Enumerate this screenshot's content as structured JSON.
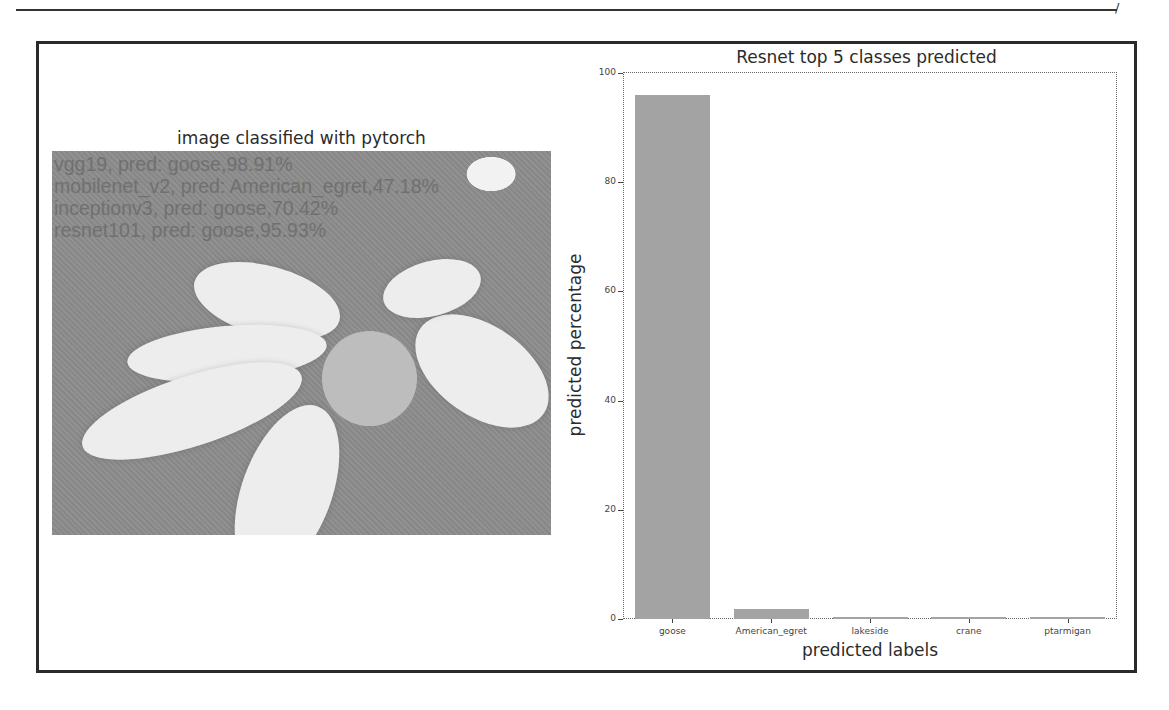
{
  "page": {
    "corner_mark": "/"
  },
  "left_panel": {
    "title": "image classified with pytorch",
    "overlay_lines": [
      "vgg19, pred: goose,98.91%",
      "mobilenet_v2, pred: American_egret,47.18%",
      "inceptionv3, pred: goose,70.42%",
      "resnet101, pred: goose,95.93%"
    ]
  },
  "chart_data": {
    "type": "bar",
    "title": "Resnet top 5 classes predicted",
    "xlabel": "predicted labels",
    "ylabel": "predicted percentage",
    "categories": [
      "goose",
      "American_egret",
      "lakeside",
      "crane",
      "ptarmigan"
    ],
    "values": [
      95.93,
      1.8,
      0.3,
      0.3,
      0.3
    ],
    "ylim": [
      0,
      100
    ],
    "yticks": [
      0,
      20,
      40,
      60,
      80,
      100
    ],
    "grid": false,
    "legend": null,
    "bar_color": "#a3a3a3"
  }
}
